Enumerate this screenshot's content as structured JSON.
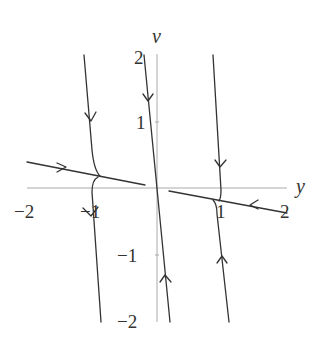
{
  "diagram": {
    "type": "phase-portrait",
    "axes": {
      "horizontal_label": "y",
      "vertical_label": "v",
      "horizontal_ticks": [
        {
          "label": "−2",
          "value": -2
        },
        {
          "label": "−1",
          "value": -1
        },
        {
          "label": "1",
          "value": 1
        },
        {
          "label": "2",
          "value": 2
        }
      ],
      "vertical_ticks": [
        {
          "label": "2",
          "value": 2
        },
        {
          "label": "1",
          "value": 1
        },
        {
          "label": "−1",
          "value": -1
        },
        {
          "label": "−2",
          "value": -2
        }
      ]
    },
    "trajectories": [
      {
        "name": "upper-left-trajectory",
        "direction": "down",
        "arrow": "down"
      },
      {
        "name": "left-slow-line",
        "direction": "right",
        "arrow": "right"
      },
      {
        "name": "lower-left-trajectory",
        "direction": "down",
        "arrow": "down"
      },
      {
        "name": "fast-manifold-line",
        "direction": "toward-origin",
        "arrows": [
          "down",
          "up"
        ]
      },
      {
        "name": "upper-right-trajectory",
        "direction": "down",
        "arrow": "down"
      },
      {
        "name": "right-slow-line",
        "direction": "left",
        "arrow": "left"
      },
      {
        "name": "lower-right-trajectory",
        "direction": "up",
        "arrow": "up"
      }
    ],
    "colors": {
      "curve": "#333333",
      "axis": "#aaaaaa",
      "text": "#333333"
    }
  }
}
